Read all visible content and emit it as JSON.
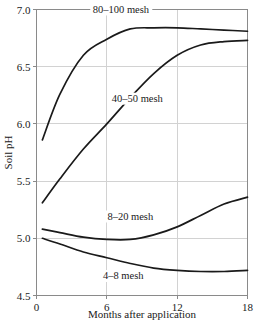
{
  "chart_data": {
    "type": "line",
    "title": "",
    "xlabel": "Months after application",
    "ylabel": "Soil pH",
    "xlim": [
      0,
      18
    ],
    "ylim": [
      4.5,
      7.0
    ],
    "xticks": [
      "0",
      "6",
      "12",
      "18"
    ],
    "xtick_values": [
      0,
      6,
      12,
      18
    ],
    "yticks": [
      "4.5",
      "5.0",
      "5.5",
      "6.0",
      "6.5",
      "7.0"
    ],
    "ytick_values": [
      4.5,
      5.0,
      5.5,
      6.0,
      6.5,
      7.0
    ],
    "grid": true,
    "legend_position": "inline-labels",
    "x": [
      0.5,
      2,
      4,
      6,
      8,
      10,
      12,
      14,
      16,
      18
    ],
    "series": [
      {
        "name": "80-100 mesh",
        "label": "80–100 mesh",
        "label_x": 7.2,
        "label_y": 6.97,
        "values": [
          5.86,
          6.26,
          6.6,
          6.74,
          6.83,
          6.84,
          6.84,
          6.83,
          6.82,
          6.81
        ]
      },
      {
        "name": "40-50 mesh",
        "label": "40–50 mesh",
        "label_x": 8.6,
        "label_y": 6.19,
        "values": [
          5.31,
          5.52,
          5.78,
          6.0,
          6.23,
          6.44,
          6.6,
          6.69,
          6.72,
          6.73
        ]
      },
      {
        "name": "8-20 mesh",
        "label": "8–20 mesh",
        "label_x": 8.0,
        "label_y": 5.16,
        "values": [
          5.08,
          5.05,
          5.01,
          4.99,
          4.99,
          5.03,
          5.1,
          5.2,
          5.3,
          5.36
        ]
      },
      {
        "name": "4-8 mesh",
        "label": "4–8 mesh",
        "label_x": 7.4,
        "label_y": 4.64,
        "values": [
          5.0,
          4.95,
          4.88,
          4.83,
          4.78,
          4.74,
          4.72,
          4.71,
          4.71,
          4.72
        ]
      }
    ]
  }
}
